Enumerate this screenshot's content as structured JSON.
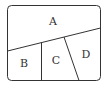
{
  "diagram": {
    "stroke_color": "#333333",
    "background": "#ffffff",
    "regions": [
      {
        "id": "A",
        "label": "A"
      },
      {
        "id": "B",
        "label": "B"
      },
      {
        "id": "C",
        "label": "C"
      },
      {
        "id": "D",
        "label": "D"
      }
    ]
  }
}
